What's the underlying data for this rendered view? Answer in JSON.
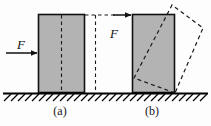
{
  "figure": {
    "background_color": "#fdfdfd"
  },
  "labels": {
    "caption_a": "(a)",
    "caption_b": "(b)",
    "force_a": "F",
    "force_b": "F"
  },
  "colors": {
    "block_fill": "#b3b3b3",
    "block_stroke": "#111111",
    "dashed_stroke": "#1a1a1a",
    "ground_stroke": "#000000",
    "arrow_stroke": "#111111",
    "text": "#101010"
  },
  "geometry": {
    "ground_y": 93,
    "block_a": {
      "x": 38,
      "y": 14,
      "width": 47,
      "height": 79
    },
    "block_b": {
      "x": 132,
      "y": 14,
      "width": 43,
      "height": 79
    },
    "center_dash_a_x": 61,
    "mid_dash_line_x": 95,
    "tilted_block_corners": "175,93 134,78 172,5 203,28"
  },
  "icons": {
    "arrow_low": "arrow-right-icon",
    "arrow_high": "arrow-right-icon",
    "hatching": "ground-hatch-icon"
  }
}
